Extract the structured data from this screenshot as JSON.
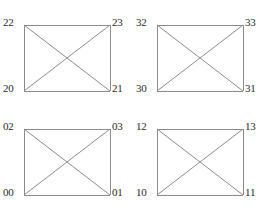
{
  "figure": {
    "type": "graph-diagram",
    "background_color": "#ffffff",
    "edge_color": "#8c8c8c",
    "label_color": "#2b2b2b"
  },
  "graphs": [
    {
      "id": "graph-top-left",
      "position": "top-left",
      "vertices": {
        "top_left": "22",
        "top_right": "23",
        "bottom_left": "20",
        "bottom_right": "21"
      }
    },
    {
      "id": "graph-top-right",
      "position": "top-right",
      "vertices": {
        "top_left": "32",
        "top_right": "33",
        "bottom_left": "30",
        "bottom_right": "31"
      }
    },
    {
      "id": "graph-bottom-left",
      "position": "bottom-left",
      "vertices": {
        "top_left": "02",
        "top_right": "03",
        "bottom_left": "00",
        "bottom_right": "01"
      }
    },
    {
      "id": "graph-bottom-right",
      "position": "bottom-right",
      "vertices": {
        "top_left": "12",
        "top_right": "13",
        "bottom_left": "10",
        "bottom_right": "11"
      }
    }
  ]
}
